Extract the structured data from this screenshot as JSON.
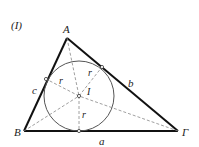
{
  "figure": {
    "tag": "(I)",
    "vertices": {
      "A": {
        "label": "A",
        "x": 67,
        "y": 38
      },
      "B": {
        "label": "B",
        "x": 24,
        "y": 131
      },
      "G": {
        "label": "Γ",
        "x": 178,
        "y": 131
      }
    },
    "incenter": {
      "label": "I",
      "x": 79,
      "y": 96
    },
    "incircle_radius": 35,
    "tangent_points": {
      "on_AB": {
        "x": 46,
        "y": 79
      },
      "on_AG": {
        "x": 102,
        "y": 67
      },
      "on_BG": {
        "x": 79,
        "y": 131
      }
    },
    "side_labels": {
      "a": "a",
      "b": "b",
      "c": "c"
    },
    "radius_label": "r",
    "colors": {
      "sides": "#111111",
      "circle": "#555555",
      "dashed": "#888888"
    }
  }
}
